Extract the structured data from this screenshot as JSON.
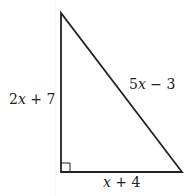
{
  "diagram": {
    "type": "right-triangle",
    "labels": {
      "left_side": "2x + 7",
      "hypotenuse": "5x − 3",
      "bottom_side": "x + 4"
    },
    "right_angle_marker": "bottom-left",
    "stroke_color": "#222222"
  }
}
